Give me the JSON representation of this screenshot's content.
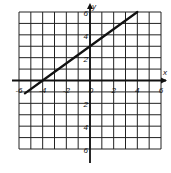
{
  "chart_data": {
    "type": "line",
    "title": "",
    "xlabel": "x",
    "ylabel": "y",
    "xlim": [
      -6,
      6
    ],
    "ylim": [
      -6,
      6
    ],
    "grid": true,
    "grid_step": 1,
    "x_ticks": [
      "-6",
      "-4",
      "-2",
      "0",
      "2",
      "4",
      "6"
    ],
    "y_ticks": [
      "6",
      "4",
      "2",
      "2",
      "4",
      "6"
    ],
    "y_tick_values": [
      6,
      4,
      2,
      -2,
      -4,
      -6
    ],
    "series": [
      {
        "name": "line",
        "equation": "y = 3/4 x + 3",
        "x": [
          -5.5,
          -4,
          0,
          4
        ],
        "y": [
          -1.125,
          0,
          3,
          6
        ]
      }
    ],
    "colors": {
      "grid": "#222222",
      "line": "#111111",
      "axis": "#111111"
    }
  }
}
